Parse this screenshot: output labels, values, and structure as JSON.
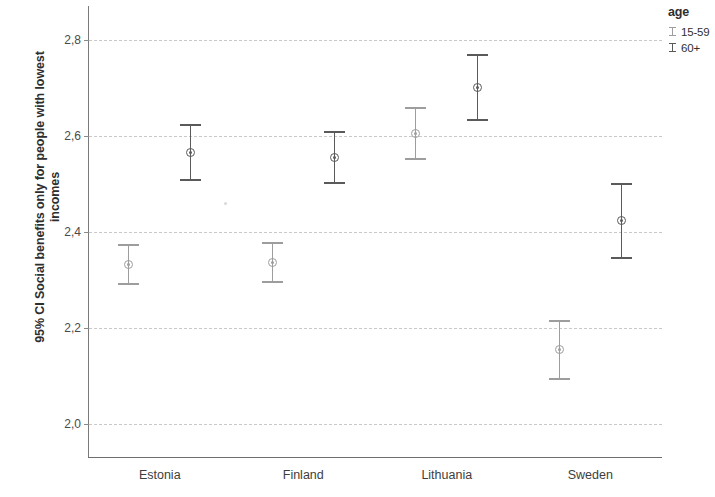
{
  "chart_data": {
    "type": "scatter",
    "title": "",
    "xlabel": "",
    "ylabel": "95% CI Social benefits only for people with lowest incomes",
    "ylabel_line1": "95% CI Social benefits only for people with lowest",
    "ylabel_line2": "incomes",
    "categories": [
      "Estonia",
      "Finland",
      "Lithuania",
      "Sweden"
    ],
    "ylim": [
      1.93,
      2.87
    ],
    "yticks": [
      2.0,
      2.2,
      2.4,
      2.6,
      2.8
    ],
    "ytick_labels": [
      "2,0",
      "2,2",
      "2,4",
      "2,6",
      "2,8"
    ],
    "grid": true,
    "grid_style": "dashed-horizontal",
    "legend_position": "right-top",
    "legend_title": "age",
    "series": [
      {
        "name": "15-59",
        "color": "#9d9d9d",
        "values": [
          2.333,
          2.336,
          2.605,
          2.155
        ],
        "ci_low": [
          2.292,
          2.296,
          2.551,
          2.094
        ],
        "ci_high": [
          2.374,
          2.377,
          2.657,
          2.214
        ]
      },
      {
        "name": "60+",
        "color": "#5a5a5a",
        "values": [
          2.566,
          2.554,
          2.7,
          2.424
        ],
        "ci_low": [
          2.508,
          2.502,
          2.632,
          2.345
        ],
        "ci_high": [
          2.622,
          2.607,
          2.768,
          2.5
        ]
      }
    ]
  },
  "legend": {
    "title": "age",
    "items": [
      {
        "label": "15-59",
        "color": "#9d9d9d"
      },
      {
        "label": "60+",
        "color": "#5a5a5a"
      }
    ]
  },
  "axes": {
    "y_title_line1": "95% CI Social benefits only for people with lowest",
    "y_title_line2": "incomes",
    "y_tick_labels": [
      "2,8",
      "2,6",
      "2,4",
      "2,2",
      "2,0"
    ],
    "x_tick_labels": [
      "Estonia",
      "Finland",
      "Lithuania",
      "Sweden"
    ]
  },
  "colors": {
    "series_young": "#9d9d9d",
    "series_old": "#5a5a5a",
    "grid": "#c9c9c9",
    "axis": "#7a7a7a",
    "background": "#ffffff"
  }
}
